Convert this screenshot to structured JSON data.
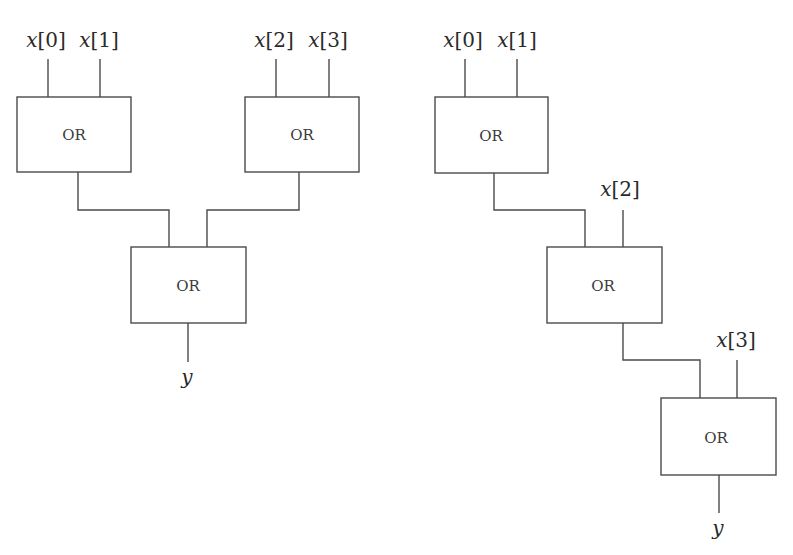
{
  "diagram": {
    "colors": {
      "stroke": "#4a4a4a",
      "text": "#2a2a2a",
      "background": "#ffffff"
    },
    "left_tree": {
      "name": "balanced OR tree",
      "gates": [
        {
          "id": "A",
          "label": "OR",
          "x": 17,
          "y": 97,
          "w": 114,
          "h": 75
        },
        {
          "id": "B",
          "label": "OR",
          "x": 245,
          "y": 97,
          "w": 114,
          "h": 75
        },
        {
          "id": "C",
          "label": "OR",
          "x": 131,
          "y": 247,
          "w": 115,
          "h": 76
        }
      ],
      "inputs": [
        {
          "var": "x",
          "index": "0",
          "x": 48
        },
        {
          "var": "x",
          "index": "1",
          "x": 100
        },
        {
          "var": "x",
          "index": "2",
          "x": 276
        },
        {
          "var": "x",
          "index": "3",
          "x": 329
        }
      ],
      "output": {
        "label": "y"
      }
    },
    "right_tree": {
      "name": "chained OR tree",
      "gates": [
        {
          "id": "D",
          "label": "OR",
          "x": 435,
          "y": 97,
          "w": 113,
          "h": 76
        },
        {
          "id": "E",
          "label": "OR",
          "x": 547,
          "y": 247,
          "w": 115,
          "h": 76
        },
        {
          "id": "F",
          "label": "OR",
          "x": 661,
          "y": 398,
          "w": 115,
          "h": 77
        }
      ],
      "inputs": [
        {
          "var": "x",
          "index": "0",
          "x": 465
        },
        {
          "var": "x",
          "index": "1",
          "x": 517
        },
        {
          "var": "x",
          "index": "2",
          "x": 623
        },
        {
          "var": "x",
          "index": "3",
          "x": 737
        }
      ],
      "output": {
        "label": "y"
      }
    }
  }
}
